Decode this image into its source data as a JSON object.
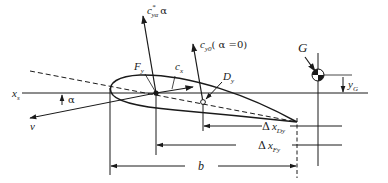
{
  "figure": {
    "type": "airfoil-force-diagram",
    "colors": {
      "line": "#1a1a1a",
      "background": "#ffffff"
    },
    "labels": {
      "lift_alpha": {
        "base": "c",
        "sup": "*",
        "sub": "yα",
        "suffix": "α"
      },
      "lift_zero": {
        "base": "c",
        "sub": "y0",
        "suffix": "( α =0)"
      },
      "drag": {
        "base": "c",
        "sub": "x"
      },
      "aero_center_force": {
        "base": "F",
        "sub": "y"
      },
      "pressure_center": {
        "base": "D",
        "sub": "y"
      },
      "velocity": "v",
      "angle": "α",
      "axis": {
        "base": "x",
        "sub": "s"
      },
      "gravity_center": "G",
      "gravity_offset": {
        "base": "y",
        "sub": "G"
      },
      "dim_dy": {
        "prefix": "Δ",
        "base": "x",
        "sub": "Dy"
      },
      "dim_fy": {
        "prefix": "Δ",
        "base": "x",
        "sub": "Fy"
      },
      "chord": "b"
    }
  }
}
